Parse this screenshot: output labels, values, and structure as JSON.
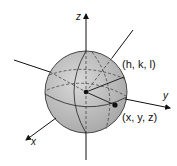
{
  "diagram": {
    "axes": {
      "z": {
        "label": "z"
      },
      "y": {
        "label": "y"
      },
      "x": {
        "label": "x"
      }
    },
    "points": {
      "center": {
        "label": "(h, k, l)"
      },
      "surface": {
        "label": "(x, y, z)"
      }
    },
    "colors": {
      "sphere_fill": "#c4c4c4",
      "sphere_stroke": "#222222",
      "axis": "#111111"
    }
  }
}
